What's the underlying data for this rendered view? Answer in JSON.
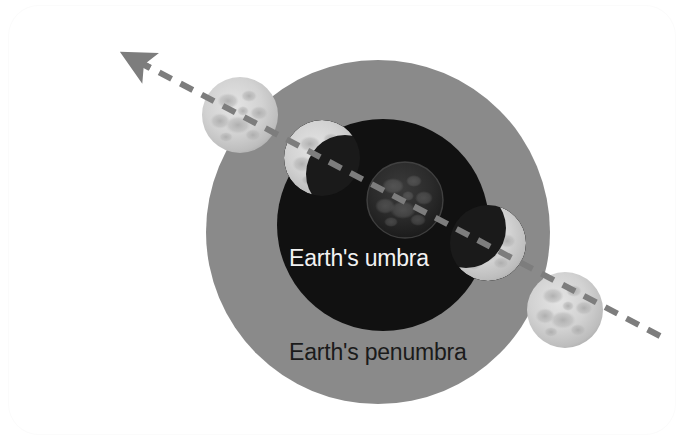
{
  "figure": {
    "title_text_visible": false,
    "background_color": "#ffffff",
    "card": {
      "corner_radius_px": 30,
      "fill": "#ffffff"
    }
  },
  "labels": {
    "umbra": "Earth's umbra",
    "penumbra": "Earth's penumbra"
  },
  "colors": {
    "penumbra_fill": "#8a8a8a",
    "umbra_fill": "#111111",
    "umbra_label_color": "#f2f2f2",
    "penumbra_label_color": "#1b1b1b",
    "path_dash_color": "#7d7d7d",
    "moon_lit_base": "#d8d8d8",
    "moon_lit_mare": "#b4b4b4",
    "moon_eclipsed": "#232323",
    "background": "#ffffff"
  },
  "shadow_regions": [
    {
      "name": "Earth's penumbra",
      "shape": "circle",
      "cx": 378,
      "cy": 232,
      "r": 172,
      "fill": "#8a8a8a"
    },
    {
      "name": "Earth's umbra",
      "shape": "circle",
      "cx": 383,
      "cy": 225,
      "r": 106,
      "fill": "#111111"
    }
  ],
  "motion_path": {
    "name": "moon-orbital-path",
    "style": "dashed",
    "direction": "lower-right to upper-left",
    "dash_color": "#7d7d7d",
    "dash_pattern": "14 10",
    "stroke_width": 6,
    "start_x": 660,
    "start_y": 336,
    "end_x": 132,
    "end_y": 58,
    "arrowhead": {
      "tip_x": 118,
      "tip_y": 50,
      "points_toward": "upper-left"
    }
  },
  "moons": [
    {
      "index": 1,
      "name": "moon-phase-1-full",
      "cx": 240,
      "cy": 115,
      "r": 38,
      "eclipse_stage": "outside umbra (penumbral only)",
      "illumination": "fully lit",
      "shadow_coverage_pct": 0
    },
    {
      "index": 2,
      "name": "moon-phase-2-partial-entering",
      "cx": 322,
      "cy": 158,
      "r": 38,
      "eclipse_stage": "partial eclipse entering umbra",
      "illumination": "crescent lit on upper-left",
      "shadow_coverage_pct": 75
    },
    {
      "index": 3,
      "name": "moon-phase-3-total",
      "cx": 405,
      "cy": 200,
      "r": 38,
      "eclipse_stage": "total eclipse at center of umbra",
      "illumination": "dim / fully shadowed",
      "shadow_coverage_pct": 100
    },
    {
      "index": 4,
      "name": "moon-phase-4-partial-exiting",
      "cx": 488,
      "cy": 243,
      "r": 38,
      "eclipse_stage": "partial eclipse exiting umbra",
      "illumination": "crescent lit on lower-right",
      "shadow_coverage_pct": 70
    },
    {
      "index": 5,
      "name": "moon-phase-5-full",
      "cx": 565,
      "cy": 310,
      "r": 38,
      "eclipse_stage": "outside umbra (penumbral only)",
      "illumination": "fully lit",
      "shadow_coverage_pct": 0
    }
  ]
}
